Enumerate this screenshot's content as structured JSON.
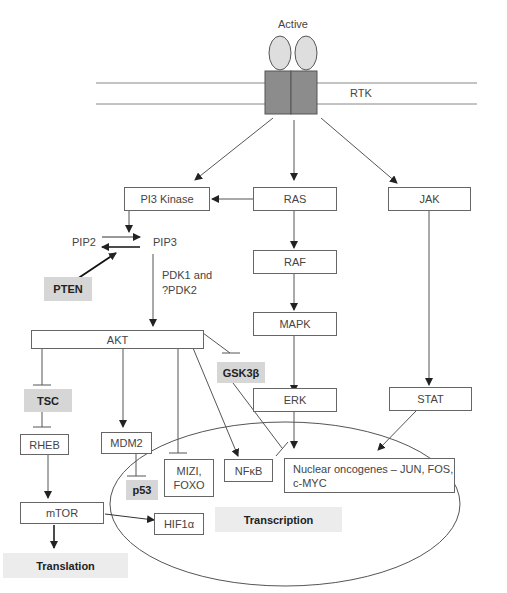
{
  "diagram": {
    "receptor": {
      "state_label": "Active",
      "name": "RTK"
    },
    "nodes": {
      "pi3k": "PI3 Kinase",
      "ras": "RAS",
      "jak": "JAK",
      "pip2": "PIP2",
      "pip3": "PIP3",
      "pten": "PTEN",
      "pdk_line1": "PDK1 and",
      "pdk_line2": "?PDK2",
      "raf": "RAF",
      "mapk": "MAPK",
      "akt": "AKT",
      "gsk3b": "GSK3β",
      "erk": "ERK",
      "stat": "STAT",
      "tsc": "TSC",
      "rheb": "RHEB",
      "mdm2": "MDM2",
      "p53": "p53",
      "mizi_line1": "MIZI,",
      "mizi_line2": "FOXO",
      "nfkb": "NFκB",
      "oncogenes_line1": "Nuclear oncogenes – JUN, FOS,",
      "oncogenes_line2": "c-MYC",
      "mtor": "mTOR",
      "hif1a": "HIF1α",
      "transcription": "Transcription",
      "translation": "Translation"
    },
    "edges": [
      {
        "from": "RTK",
        "to": "PI3 Kinase",
        "type": "activate"
      },
      {
        "from": "RTK",
        "to": "RAS",
        "type": "activate"
      },
      {
        "from": "RTK",
        "to": "JAK",
        "type": "activate"
      },
      {
        "from": "RAS",
        "to": "PI3 Kinase",
        "type": "activate"
      },
      {
        "from": "PI3 Kinase",
        "to": "PIP2→PIP3",
        "type": "activate"
      },
      {
        "from": "PTEN",
        "to": "PIP3→PIP2",
        "type": "activate"
      },
      {
        "from": "PIP3",
        "to": "AKT",
        "type": "activate",
        "via": "PDK1 and ?PDK2"
      },
      {
        "from": "RAS",
        "to": "RAF",
        "type": "activate"
      },
      {
        "from": "RAF",
        "to": "MAPK",
        "type": "activate"
      },
      {
        "from": "MAPK",
        "to": "ERK",
        "type": "activate"
      },
      {
        "from": "JAK",
        "to": "STAT",
        "type": "activate"
      },
      {
        "from": "AKT",
        "to": "TSC",
        "type": "inhibit"
      },
      {
        "from": "TSC",
        "to": "RHEB",
        "type": "inhibit"
      },
      {
        "from": "AKT",
        "to": "MDM2",
        "type": "activate"
      },
      {
        "from": "MDM2",
        "to": "p53",
        "type": "inhibit"
      },
      {
        "from": "AKT",
        "to": "MIZI, FOXO",
        "type": "inhibit"
      },
      {
        "from": "AKT",
        "to": "NFκB",
        "type": "activate"
      },
      {
        "from": "AKT",
        "to": "GSK3β",
        "type": "inhibit"
      },
      {
        "from": "GSK3β",
        "to": "Nuclear oncogenes",
        "type": "inhibit"
      },
      {
        "from": "ERK",
        "to": "Nuclear oncogenes",
        "type": "activate"
      },
      {
        "from": "STAT",
        "to": "Nuclear oncogenes",
        "type": "activate"
      },
      {
        "from": "RHEB",
        "to": "mTOR",
        "type": "activate"
      },
      {
        "from": "mTOR",
        "to": "HIF1α",
        "type": "activate"
      },
      {
        "from": "mTOR",
        "to": "Translation",
        "type": "activate"
      }
    ]
  }
}
